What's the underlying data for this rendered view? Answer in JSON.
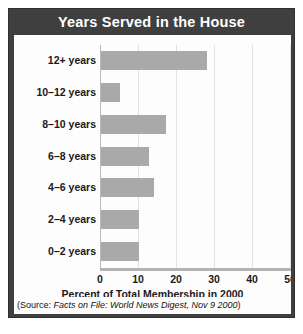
{
  "chart_data": {
    "type": "bar",
    "orientation": "horizontal",
    "title": "Years Served in the House",
    "xlabel": "Percent of Total Membership in 2000",
    "ylabel": "",
    "categories": [
      "12+ years",
      "10–12 years",
      "8–10 years",
      "6–8 years",
      "4–6 years",
      "2–4 years",
      "0–2 years"
    ],
    "values": [
      28,
      5,
      17,
      12.5,
      14,
      10,
      10
    ],
    "xlim": [
      0,
      50
    ],
    "xticks": [
      0,
      10,
      20,
      30,
      40,
      50
    ],
    "xtick_labels": [
      "0",
      "10",
      "20",
      "30",
      "40",
      "50"
    ],
    "grid": "vertical",
    "legend": "none",
    "bar_color": "#a9a9a9"
  },
  "source": {
    "prefix": "(Source: ",
    "italic": "Facts on File: World News Digest, Nov 9 2000",
    "suffix": ")"
  },
  "colors": {
    "frame": "#3f3f3f",
    "title_text": "#ffffff",
    "panel": "#fdfdfd",
    "bar": "#a9a9a9",
    "gridline": "#e2e2e2",
    "axis": "#b3b3b3"
  }
}
